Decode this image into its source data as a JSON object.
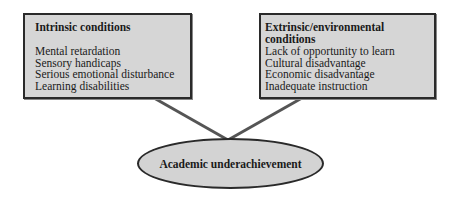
{
  "diagram": {
    "left_box": {
      "title": "Intrinsic conditions",
      "items": [
        "Mental retardation",
        "Sensory handicaps",
        "Serious emotional disturbance",
        "Learning disabilities"
      ]
    },
    "right_box": {
      "title": "Extrinsic/environmental conditions",
      "items": [
        "Lack of opportunity to learn",
        "Cultural disadvantage",
        "Economic disadvantage",
        "Inadequate instruction"
      ]
    },
    "outcome": {
      "label": "Academic underachievement"
    },
    "colors": {
      "box_fill": "#d6d6d6",
      "border": "#2a2a2a",
      "connector": "#555555"
    }
  }
}
